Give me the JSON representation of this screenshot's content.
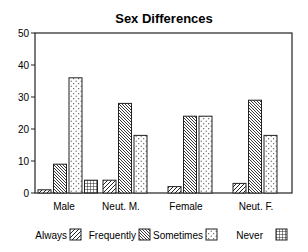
{
  "chart_data": {
    "type": "bar",
    "title": "Sex Differences",
    "xlabel": "",
    "ylabel": "",
    "ylim": [
      0,
      50
    ],
    "yticks": [
      0,
      10,
      20,
      30,
      40,
      50
    ],
    "grid": false,
    "legend_position": "bottom",
    "categories": [
      "Male",
      "Neut. M.",
      "Female",
      "Neut. F."
    ],
    "series": [
      {
        "name": "Always",
        "pattern": "diagonal-up",
        "values": [
          1,
          4,
          2,
          3
        ]
      },
      {
        "name": "Frequently",
        "pattern": "diagonal-down",
        "values": [
          9,
          28,
          24,
          29
        ]
      },
      {
        "name": "Sometimes",
        "pattern": "dots",
        "values": [
          36,
          18,
          24,
          18
        ]
      },
      {
        "name": "Never",
        "pattern": "grid",
        "values": [
          4,
          0,
          0,
          0
        ]
      }
    ]
  },
  "colors": {
    "line": "#222222",
    "background": "#ffffff"
  }
}
